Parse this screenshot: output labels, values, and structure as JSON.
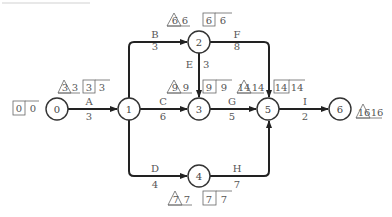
{
  "header_residue": "",
  "nodes": [
    {
      "id": "0",
      "x": 57,
      "y": 109
    },
    {
      "id": "1",
      "x": 129,
      "y": 109
    },
    {
      "id": "2",
      "x": 199,
      "y": 42
    },
    {
      "id": "3",
      "x": 199,
      "y": 109
    },
    {
      "id": "4",
      "x": 199,
      "y": 176
    },
    {
      "id": "5",
      "x": 268,
      "y": 109
    },
    {
      "id": "6",
      "x": 340,
      "y": 109
    }
  ],
  "activities": [
    {
      "name": "A",
      "duration": "3",
      "from": "0",
      "to": "1"
    },
    {
      "name": "B",
      "duration": "3",
      "from": "1",
      "to": "2"
    },
    {
      "name": "C",
      "duration": "6",
      "from": "1",
      "to": "3"
    },
    {
      "name": "D",
      "duration": "4",
      "from": "1",
      "to": "4"
    },
    {
      "name": "E",
      "duration": "3",
      "from": "2",
      "to": "3"
    },
    {
      "name": "F",
      "duration": "8",
      "from": "2",
      "to": "5"
    },
    {
      "name": "G",
      "duration": "5",
      "from": "3",
      "to": "5"
    },
    {
      "name": "H",
      "duration": "7",
      "from": "4",
      "to": "5"
    },
    {
      "name": "I",
      "duration": "2",
      "from": "5",
      "to": "6"
    }
  ],
  "event_times": {
    "n0": {
      "box_earliest": "0",
      "box_latest": "0"
    },
    "n1": {
      "tri": "3",
      "tri_value": "3",
      "box_earliest": "3",
      "box_latest": "3"
    },
    "n2": {
      "tri": "6",
      "tri_value": "6",
      "box_earliest": "6",
      "box_latest": "6"
    },
    "n3": {
      "tri": "9",
      "tri_value": "9",
      "box_earliest": "9",
      "box_latest": "9"
    },
    "n4": {
      "tri": "7",
      "tri_value": "7",
      "box_earliest": "7",
      "box_latest": "7"
    },
    "n5": {
      "tri": "14",
      "tri_value": "14",
      "box_earliest": "14",
      "box_latest": "14"
    },
    "n6": {
      "tri": "16",
      "tri_value": "16"
    }
  },
  "colors": {
    "line": "#222222",
    "text": "#555555",
    "node_stroke": "#333333"
  }
}
